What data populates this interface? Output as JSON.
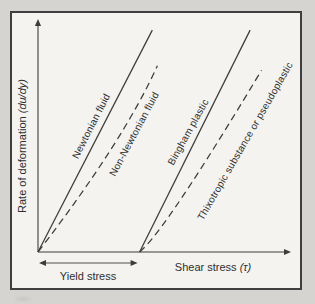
{
  "colors": {
    "line": "#3c3c3c",
    "text": "#2f2f2f",
    "page_bg": "#d5d4d1",
    "plot_bg": "#f4f3f0",
    "frame_border": "#3f3f3f"
  },
  "chart_data": {
    "type": "line",
    "title": "",
    "qualitative": true,
    "xlabel": "Shear stress (τ)",
    "ylabel": "Rate of deformation (du/dy)",
    "x_axis": {
      "label": "Shear stress",
      "symbol": "(τ)"
    },
    "y_axis": {
      "label": "Rate of deformation",
      "symbol": "(du/dy)"
    },
    "x_range": [
      0,
      100
    ],
    "y_range": [
      0,
      100
    ],
    "grid": "off",
    "legend": "labels-along-curves",
    "series": [
      {
        "name": "Newtonian fluid",
        "style": "solid",
        "points": [
          [
            0,
            0
          ],
          [
            45,
            96.5
          ]
        ]
      },
      {
        "name": "Non-Newtonian fluid",
        "style": "dashed",
        "points": [
          [
            0,
            0
          ],
          [
            33.5,
            48
          ],
          [
            47,
            81
          ]
        ]
      },
      {
        "name": "Bingham plastic",
        "style": "solid",
        "points": [
          [
            40,
            0
          ],
          [
            83.5,
            96.5
          ]
        ]
      },
      {
        "name": "Thixotropic substance or pseudoplastic",
        "style": "dashed",
        "points": [
          [
            40,
            0
          ],
          [
            50,
            9
          ],
          [
            88,
            79
          ]
        ]
      }
    ],
    "yield_annotation": {
      "label": "Yield stress",
      "x_from": 0,
      "x_to": 40
    }
  }
}
